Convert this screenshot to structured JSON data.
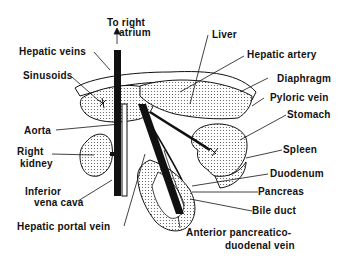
{
  "diagram": {
    "type": "anatomical",
    "colors": {
      "ink": "#111111",
      "background": "#ffffff",
      "stipple": "#555555"
    },
    "labels": {
      "to_right_atrium_1": "To right",
      "to_right_atrium_2": "atrium",
      "hepatic_veins": "Hepatic veins",
      "sinusoids": "Sinusoids",
      "aorta": "Aorta",
      "right_kidney_1": "Right",
      "right_kidney_2": "kidney",
      "inferior_vena_cava_1": "Inferior",
      "inferior_vena_cava_2": "vena cava",
      "hepatic_portal_vein": "Hepatic portal vein",
      "liver": "Liver",
      "hepatic_artery": "Hepatic artery",
      "diaphragm": "Diaphragm",
      "pyloric_vein": "Pyloric vein",
      "stomach": "Stomach",
      "spleen": "Spleen",
      "duodenum": "Duodenum",
      "pancreas": "Pancreas",
      "bile_duct": "Bile duct",
      "apdv_1": "Anterior pancreatico-",
      "apdv_2": "duodenal vein"
    }
  }
}
